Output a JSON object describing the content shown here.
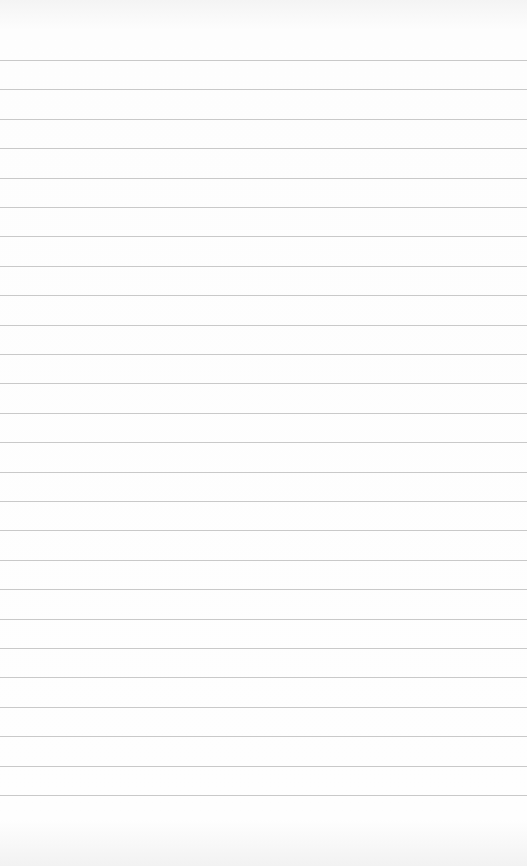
{
  "page": {
    "type": "lined-notepad-page",
    "text": "",
    "line_count": 26,
    "first_line_y": 60,
    "line_spacing": 29.4,
    "line_color": "#c9c9c9",
    "background": "#fdfdfd"
  }
}
